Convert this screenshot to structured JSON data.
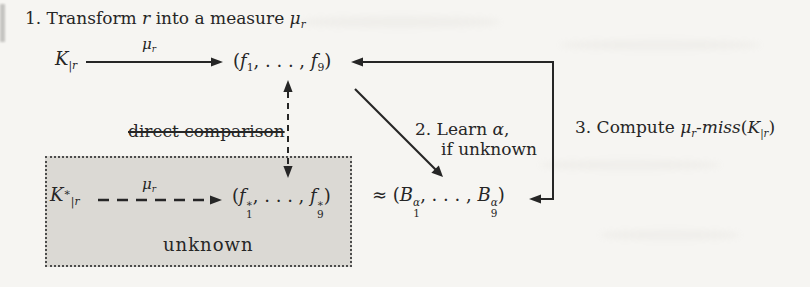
{
  "colors": {
    "page_bg": "#f6f5f2",
    "ink": "#262626",
    "box_fill": "#dbd9d4",
    "box_border_dots": "#4c4c4c"
  },
  "steps": {
    "s1": {
      "pre": "1. Transform",
      "r": "r",
      "mid": "into a measure",
      "mu": "μ",
      "mu_sub": "r"
    },
    "s2": {
      "pre": "2. Learn",
      "alpha": "α",
      "comma": ",",
      "line2": "if unknown"
    },
    "s3": {
      "pre": "3. Compute",
      "mu": "μ",
      "mu_sub": "r",
      "hyphen": "-",
      "miss": "miss",
      "open": "(",
      "K": "K",
      "K_sub": "|r",
      "close": ")"
    }
  },
  "nodes": {
    "k": {
      "base": "K",
      "sub": "|r"
    },
    "mu_label": {
      "base": "μ",
      "sub": "r"
    },
    "f_tuple": {
      "open": "(",
      "f": "f",
      "sub1": "1",
      "dots": ", . . . ,",
      "sub9": "9",
      "close": ")"
    },
    "k_star": {
      "base": "K",
      "sup": "∗",
      "sub": "|r"
    },
    "f_star_tuple": {
      "open": "(",
      "f": "f",
      "sup": "∗",
      "sub1": "1",
      "dots": ", . . . ,",
      "sub9": "9",
      "close": ")"
    },
    "approx_tuple": {
      "rel": "≈",
      "open": "(",
      "B": "B",
      "sup": "α",
      "sub1": "1",
      "dots": ", . . . ,",
      "sub9": "9",
      "close": ")"
    },
    "direct_comparison": "direct comparison",
    "unknown": "unknown"
  }
}
